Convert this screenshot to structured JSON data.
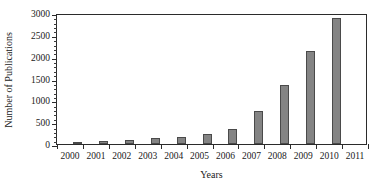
{
  "chart_data": {
    "type": "bar",
    "title": "",
    "xlabel": "Years",
    "ylabel": "Number of Publications",
    "categories": [
      "2000",
      "2001",
      "2002",
      "2003",
      "2004",
      "2005",
      "2006",
      "2007",
      "2008",
      "2009",
      "2010",
      "2011"
    ],
    "values": [
      50,
      80,
      100,
      130,
      170,
      230,
      345,
      760,
      1350,
      2130,
      2885,
      0
    ],
    "ylim": [
      0,
      3000
    ],
    "ytick_labels": [
      "0",
      "500",
      "1000",
      "1500",
      "2000",
      "2500",
      "3000"
    ],
    "ytick_values": [
      0,
      500,
      1000,
      1500,
      2000,
      2500,
      3000
    ],
    "ytick_minor_step": 100,
    "grid": false,
    "legend": "none",
    "bar_color": "#848484",
    "bar_edge_color": "#4a4a4a",
    "axis_color": "#2b2b2b"
  }
}
